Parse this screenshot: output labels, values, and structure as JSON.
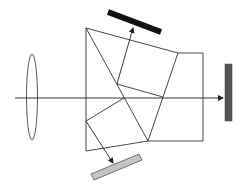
{
  "diagram": {
    "type": "optical-prism-beam-splitter",
    "colors": {
      "line": "#333333",
      "sensor_top": "#111111",
      "sensor_right": "#555555",
      "sensor_bottom": "#c4c4c4",
      "sensor_bottom_stroke": "#555555",
      "background": "#ffffff"
    },
    "elements": {
      "lens": "lens",
      "optical_axis": "optical-axis-arrow",
      "prism_assembly": "prism-assembly",
      "sensor_top": "sensor-top",
      "sensor_right": "sensor-right",
      "sensor_bottom": "sensor-bottom"
    }
  }
}
